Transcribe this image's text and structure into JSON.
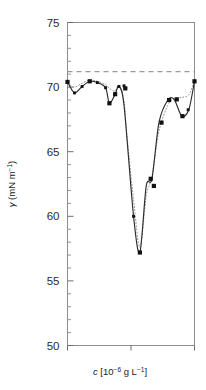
{
  "figure": {
    "background": "#ffffff",
    "frame_color": "#6e6e6e",
    "series_solid_color": "#2b2b2b",
    "series_dotted_color": "#8a8a8a",
    "marker_color": "#111111",
    "reference_line_color": "#9a9a9a"
  },
  "axes": {
    "y": {
      "label_gamma": "γ",
      "label_units": "(mN m",
      "label_units_sup": "−1",
      "label_units_close": ")",
      "ticks": [
        "50",
        "55",
        "60",
        "65",
        "70",
        "75"
      ],
      "min": 50,
      "max": 75,
      "minor_step": 1
    },
    "x": {
      "label_c": "c",
      "label_bracket_open": "[10",
      "label_exp": "−6",
      "label_mid": " g L",
      "label_exp2": "−1",
      "label_bracket_close": "]",
      "ticks": [
        "",
        "",
        ""
      ],
      "min": 0,
      "max": 1
    }
  },
  "chart_data": {
    "type": "line",
    "title": "",
    "xlabel": "c [10^-6 g L^-1]",
    "ylabel": "γ (mN m^-1)",
    "xlim": [
      0,
      1
    ],
    "ylim": [
      50,
      75
    ],
    "grid": false,
    "legend_position": "none",
    "y_ticks": [
      50,
      55,
      60,
      65,
      70,
      75
    ],
    "y_minor_ticks": [
      51,
      52,
      53,
      54,
      56,
      57,
      58,
      59,
      61,
      62,
      63,
      64,
      66,
      67,
      68,
      69,
      71,
      72,
      73,
      74
    ],
    "x_ticks": [
      0,
      0.5,
      1
    ],
    "reference_line": {
      "style": "dashed",
      "y": 71.2,
      "label": ""
    },
    "series": [
      {
        "name": "measured (solid)",
        "style": "solid",
        "marker": "square",
        "x": [
          0.0,
          0.055,
          0.115,
          0.175,
          0.235,
          0.3,
          0.33,
          0.375,
          0.405,
          0.445,
          0.52,
          0.57,
          0.62,
          0.665,
          0.72,
          0.79,
          0.84,
          0.9,
          0.955,
          1.0
        ],
        "y": [
          70.4,
          69.55,
          70.05,
          70.45,
          70.35,
          69.95,
          68.75,
          69.45,
          70.05,
          68.6,
          60.0,
          57.2,
          62.35,
          62.9,
          67.25,
          69.0,
          69.05,
          67.75,
          68.25,
          70.45
        ]
      },
      {
        "name": "fitted (dotted)",
        "style": "dotted",
        "marker": "none",
        "x": [
          0.0,
          0.055,
          0.115,
          0.175,
          0.235,
          0.3,
          0.33,
          0.375,
          0.405,
          0.445,
          0.47,
          0.52,
          0.57,
          0.62,
          0.665,
          0.72,
          0.79,
          0.84,
          0.9,
          0.955,
          1.0
        ],
        "y": [
          70.3,
          70.0,
          70.3,
          70.55,
          70.45,
          70.2,
          69.9,
          69.7,
          70.1,
          68.9,
          66.0,
          61.3,
          57.6,
          61.6,
          63.1,
          66.6,
          68.6,
          69.1,
          69.2,
          69.4,
          70.5
        ]
      }
    ],
    "data_points": [
      {
        "x": 0.0,
        "y": 70.4,
        "size": "large"
      },
      {
        "x": 0.055,
        "y": 69.55,
        "size": "small"
      },
      {
        "x": 0.115,
        "y": 70.05,
        "size": "small"
      },
      {
        "x": 0.175,
        "y": 70.45,
        "size": "large"
      },
      {
        "x": 0.235,
        "y": 70.35,
        "size": "small"
      },
      {
        "x": 0.3,
        "y": 69.95,
        "size": "small"
      },
      {
        "x": 0.33,
        "y": 68.75,
        "size": "large"
      },
      {
        "x": 0.375,
        "y": 69.45,
        "size": "large"
      },
      {
        "x": 0.405,
        "y": 70.05,
        "size": "small"
      },
      {
        "x": 0.445,
        "y": 70.1,
        "size": "small"
      },
      {
        "x": 0.455,
        "y": 69.9,
        "size": "large"
      },
      {
        "x": 0.52,
        "y": 60.0,
        "size": "small"
      },
      {
        "x": 0.57,
        "y": 57.2,
        "size": "large"
      },
      {
        "x": 0.655,
        "y": 62.9,
        "size": "large"
      },
      {
        "x": 0.68,
        "y": 62.35,
        "size": "large"
      },
      {
        "x": 0.74,
        "y": 67.25,
        "size": "large"
      },
      {
        "x": 0.8,
        "y": 69.0,
        "size": "large"
      },
      {
        "x": 0.86,
        "y": 69.05,
        "size": "large"
      },
      {
        "x": 0.905,
        "y": 67.75,
        "size": "large"
      },
      {
        "x": 0.95,
        "y": 68.25,
        "size": "small"
      },
      {
        "x": 1.0,
        "y": 70.45,
        "size": "large"
      }
    ]
  }
}
